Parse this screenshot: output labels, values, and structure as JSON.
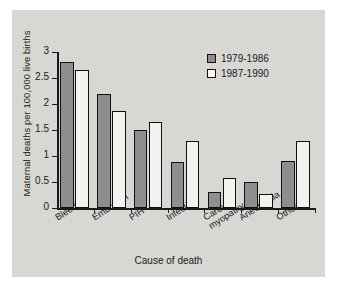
{
  "chart_data": {
    "type": "bar",
    "title": "",
    "xlabel": "Cause of death",
    "ylabel": "Maternal deaths per 100,000 live births",
    "categories": [
      "Bleeding",
      "Embolism",
      "PIH",
      "Infection",
      "Cardio-myopathy",
      "Anesthesia",
      "Other"
    ],
    "category_lines": [
      [
        "Bleeding"
      ],
      [
        "Embolism"
      ],
      [
        "PIH"
      ],
      [
        "Infection"
      ],
      [
        "Cardio-",
        "myopathy"
      ],
      [
        "Anesthesia"
      ],
      [
        "Other"
      ]
    ],
    "series": [
      {
        "name": "1979-1986",
        "color": "#8e8e8e",
        "values": [
          2.8,
          2.2,
          1.5,
          0.88,
          0.3,
          0.5,
          0.9
        ]
      },
      {
        "name": "1987-1990",
        "color": "#f2f2ee",
        "values": [
          2.65,
          1.87,
          1.65,
          1.28,
          0.58,
          0.27,
          1.28
        ]
      }
    ],
    "ylim": [
      0,
      3
    ],
    "yticks": [
      0,
      0.5,
      1,
      1.5,
      2,
      2.5,
      3
    ],
    "ytick_labels": [
      "0",
      "0.5",
      "1",
      "1.5",
      "2",
      "2.5",
      "3"
    ],
    "grid": false,
    "legend_position": "top-right",
    "background_color": "#d7d7d3",
    "axis_color": "#1a1a1a"
  },
  "legend": {
    "entries": [
      {
        "label": "1979-1986"
      },
      {
        "label": "1987-1990"
      }
    ]
  }
}
